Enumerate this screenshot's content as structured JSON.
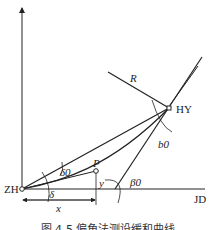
{
  "diagram": {
    "labels": {
      "zh": "ZH",
      "hy": "HY",
      "jd": "JD",
      "radius": "R",
      "point_p": "P",
      "x": "x",
      "y": "y",
      "delta": "δ",
      "delta0": "δ0",
      "beta0": "β0",
      "b0": "b0"
    },
    "caption": "图 4-5  偏角法测设缓和曲线",
    "colors": {
      "stroke": "#222222",
      "background": "#ffffff"
    }
  }
}
